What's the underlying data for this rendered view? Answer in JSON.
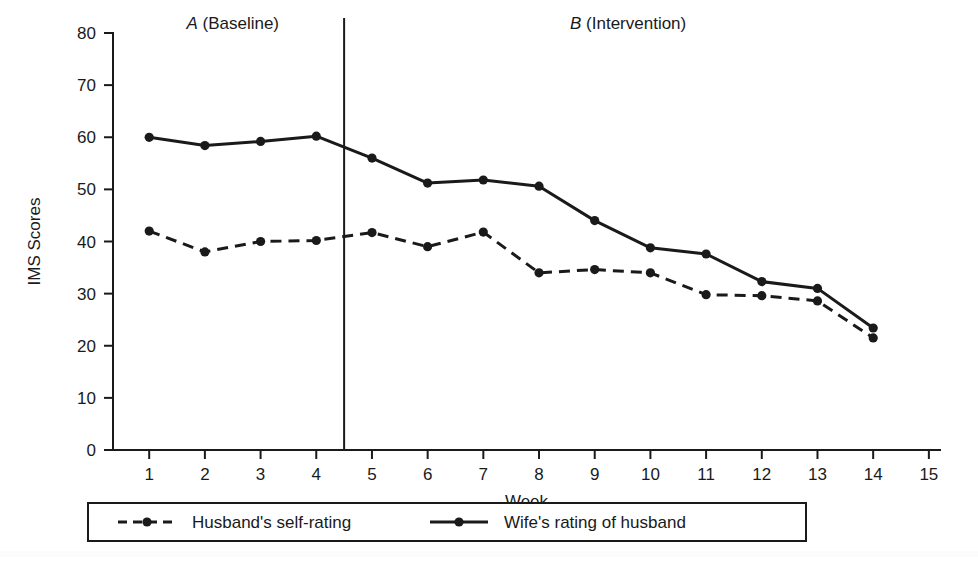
{
  "chart_data": {
    "type": "line",
    "title": "",
    "xlabel": "Week",
    "ylabel": "IMS Scores",
    "xlim": [
      0.35,
      15.2
    ],
    "ylim": [
      0,
      80
    ],
    "grid": false,
    "legend_position": "bottom",
    "x": [
      1,
      2,
      3,
      4,
      5,
      6,
      7,
      8,
      9,
      10,
      11,
      12,
      13,
      14
    ],
    "xticks": [
      1,
      2,
      3,
      4,
      5,
      6,
      7,
      8,
      9,
      10,
      11,
      12,
      13,
      14,
      15
    ],
    "xticklabels": [
      "1",
      "2",
      "3",
      "4",
      "5",
      "6",
      "7",
      "8",
      "9",
      "10",
      "11",
      "12",
      "13",
      "14",
      "15"
    ],
    "yticks": [
      0,
      10,
      20,
      30,
      40,
      50,
      60,
      70,
      80
    ],
    "yticklabels": [
      "0",
      "10",
      "20",
      "30",
      "40",
      "50",
      "60",
      "70",
      "80"
    ],
    "series": [
      {
        "name": "Husband's self-rating",
        "style": "dashed",
        "marker": "circle",
        "color": "#1a1a1a",
        "values": [
          42,
          38,
          40,
          40.2,
          41.7,
          39,
          41.8,
          34,
          34.6,
          34,
          29.8,
          29.6,
          28.6,
          21.5
        ]
      },
      {
        "name": "Wife's rating of husband",
        "style": "solid",
        "marker": "circle",
        "color": "#1a1a1a",
        "values": [
          60,
          58.4,
          59.2,
          60.2,
          56,
          51.2,
          51.8,
          50.6,
          44,
          38.8,
          37.6,
          32.3,
          31,
          23.4
        ]
      }
    ],
    "annotations": [
      {
        "name": "phase-a-label",
        "letter": "A",
        "text": " (Baseline)",
        "x_center": 2.5
      },
      {
        "name": "phase-b-label",
        "letter": "B",
        "text": " (Intervention)",
        "x_center": 9.6
      }
    ],
    "phase_divider": {
      "name": "phase-divider",
      "x": 4.5
    }
  },
  "legend": {
    "entries": [
      {
        "label": "Husband's self-rating",
        "style": "dashed"
      },
      {
        "label": "Wife's rating of husband",
        "style": "solid"
      }
    ]
  }
}
